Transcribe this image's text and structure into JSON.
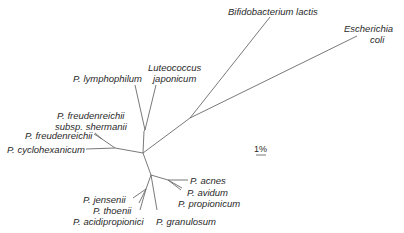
{
  "scale_bar": {
    "label": "1%"
  },
  "taxa": {
    "bifidobacterium": "Bifidobacterium lactis",
    "escherichia_1": "Escherichia",
    "escherichia_2": "coli",
    "luteococcus_1": "Luteococcus",
    "luteococcus_2": "japonicum",
    "lymphophilum": "P. lymphophilum",
    "shermanii_1": "P. freudenreichii",
    "shermanii_2": "subsp. shermanii",
    "freudenreichii": "P. freudenreichii",
    "cyclohexanicum": "P. cyclohexanicum",
    "acnes": "P. acnes",
    "avidum": "P. avidum",
    "propionicum": "P. propionicum",
    "jensenii": "P. jensenii",
    "thoenii": "P. thoenii",
    "acidipropionici": "P. acidipropionici",
    "granulosum": "P. granulosum"
  },
  "colors": {
    "branch": "#6a6a6a",
    "text": "#2a2a2a",
    "background": "#ffffff"
  }
}
